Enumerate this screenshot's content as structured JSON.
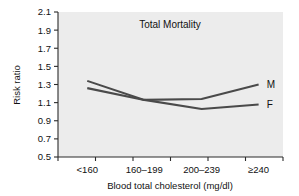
{
  "figure": {
    "background_color": "#ffffff",
    "plot_background_color": "#ececec",
    "axis_color": "#2b2b2b",
    "text_color": "#111111"
  },
  "chart_data": {
    "type": "line",
    "title": "Total Mortality",
    "xlabel": "Blood total cholesterol (mg/dl)",
    "ylabel": "Risk ratio",
    "categories": [
      "<160",
      "160–199",
      "200–239",
      "≥240"
    ],
    "yticks": [
      "0.5",
      "0.7",
      "0.9",
      "1.1",
      "1.3",
      "1.5",
      "1.7",
      "1.9",
      "2.1"
    ],
    "ylim": [
      0.5,
      2.1
    ],
    "grid": false,
    "legend_position": "right-inline",
    "series": [
      {
        "name": "M",
        "label": "M",
        "color": "#4a4a4a",
        "values": [
          1.34,
          1.13,
          1.14,
          1.3
        ]
      },
      {
        "name": "F",
        "label": "F",
        "color": "#4a4a4a",
        "values": [
          1.26,
          1.13,
          1.03,
          1.08
        ]
      }
    ]
  }
}
